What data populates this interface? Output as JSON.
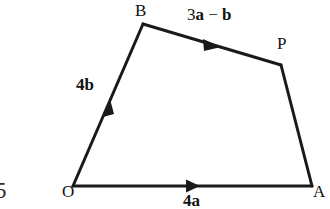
{
  "figure": {
    "type": "vector-diagram",
    "background_color": "#ffffff",
    "stroke_color": "#1a1a1a",
    "text_color": "#121212",
    "width": 330,
    "height": 209,
    "page_number": "5",
    "vertices": [
      {
        "name": "O",
        "label": "O",
        "x": 73,
        "y": 186
      },
      {
        "name": "B",
        "label": "B",
        "x": 143,
        "y": 24
      },
      {
        "name": "P",
        "label": "P",
        "x": 281,
        "y": 65
      },
      {
        "name": "A",
        "label": "A",
        "x": 312,
        "y": 186
      }
    ],
    "edges": [
      {
        "name": "O-to-A",
        "from": "O",
        "to": "A",
        "arrow": true,
        "arrow_at_x": 193,
        "arrow_at_y": 186,
        "label_plain": "4a",
        "label_coefficient": "4",
        "label_vector": "a"
      },
      {
        "name": "O-to-B",
        "from": "O",
        "to": "B",
        "arrow": true,
        "arrow_at_x": 108,
        "arrow_at_y": 105,
        "label_plain": "4b",
        "label_coefficient": "4",
        "label_vector": "b"
      },
      {
        "name": "B-to-P",
        "from": "B",
        "to": "P",
        "arrow": true,
        "arrow_at_x": 215,
        "arrow_at_y": 45,
        "label_plain": "3a − b",
        "label_coefficient": "3",
        "label_vector_1": "a",
        "label_operator": "−",
        "label_vector_2": "b"
      },
      {
        "name": "P-to-A",
        "from": "P",
        "to": "A",
        "arrow": false,
        "label_plain": ""
      }
    ]
  },
  "labels": {
    "vertex_O": "O",
    "vertex_B": "B",
    "vertex_P": "P",
    "vertex_A": "A",
    "vector_4b_coeff": "4",
    "vector_4b_letter": "b",
    "vector_4a_coeff": "4",
    "vector_4a_letter": "a",
    "vector_3a_coeff": "3",
    "vector_3a_letter": "a",
    "vector_minus_operator": " − ",
    "vector_b_letter": "b",
    "page_number": "5"
  }
}
